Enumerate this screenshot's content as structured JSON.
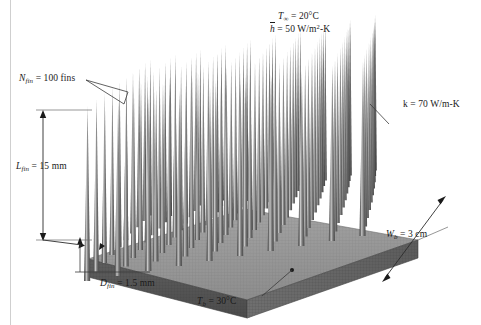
{
  "figure": {
    "caption_absent": true
  },
  "annotations": {
    "ambient_temperature": {
      "symbol": "T",
      "subscript": "∞",
      "text": "T∞ = 20°C",
      "value": "20",
      "unit": "°C"
    },
    "convection_coefficient": {
      "symbol": "h",
      "text": "h̄ = 50 W/m²-K",
      "value": "50",
      "unit": "W/m²-K"
    },
    "fin_count": {
      "symbol": "N",
      "subscript": "fin",
      "text": "Nfin = 100 fins",
      "value": "100",
      "unit": "fins"
    },
    "fin_length": {
      "symbol": "L",
      "subscript": "fin",
      "text": "Lfin = 15 mm",
      "value": "15",
      "unit": "mm"
    },
    "fin_diameter": {
      "symbol": "D",
      "subscript": "fin",
      "text": "Dfin = 1.5 mm",
      "value": "1.5",
      "unit": "mm"
    },
    "base_temperature": {
      "symbol": "T",
      "subscript": "b",
      "text": "Tb = 30°C",
      "value": "30",
      "unit": "°C"
    },
    "base_width": {
      "symbol": "W",
      "subscript": "b",
      "text": "Wb = 3 cm",
      "value": "3",
      "unit": "cm"
    },
    "thermal_conductivity": {
      "symbol": "k",
      "text": "k = 70 W/m-K",
      "value": "70",
      "unit": "W/m-K"
    }
  },
  "label_parts": {
    "T_inf": "T",
    "inf_sub": "∞",
    "eq_20C": "= 20°C",
    "h_bar": "h",
    "eq_50": "= 50 W/m",
    "sup2": "2",
    "dashK": "-K",
    "N": "N",
    "fin_sub": "fin",
    "eq_100_fins": "= 100 fins",
    "L": "L",
    "eq_15mm": "= 15 mm",
    "D": "D",
    "eq_15mm_dia": "= 1.5 mm",
    "T": "T",
    "b_sub": "b",
    "eq_30C": "= 30°C",
    "W": "W",
    "eq_3cm": "= 3 cm",
    "k_text": "k = 70 W/m-K"
  },
  "geometry": {
    "fin_rows": 10,
    "fin_cols": 10,
    "fin_shape": "tapered-cone",
    "base_shape": "square-plate-isometric"
  },
  "colors": {
    "fin_body": "#7b7b7b",
    "fin_highlight": "#b9b9b9",
    "fin_shadow": "#555555",
    "base_top": "#9a9a9a",
    "base_front": "#565656",
    "base_side": "#6e6e6e",
    "background": "#ffffff",
    "label_text": "#1a1a1a",
    "leader_line": "#3a3a3a"
  }
}
